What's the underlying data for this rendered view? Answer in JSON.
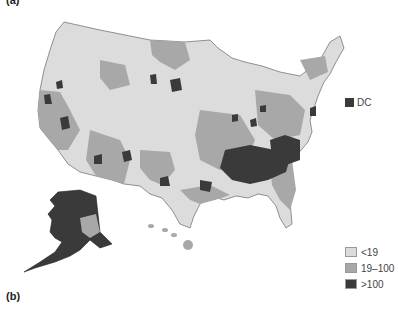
{
  "panels": {
    "a_label": "(a)",
    "b_label": "(b)"
  },
  "map": {
    "region": "United States counties (contiguous US, Alaska, Hawaii)",
    "inset_label": "DC",
    "inset_category": ">100"
  },
  "legend": {
    "items": [
      {
        "label": "<19",
        "color": "#dcdcdc"
      },
      {
        "label": "19–100",
        "color": "#a8a8a8"
      },
      {
        "label": ">100",
        "color": "#3a3a3a"
      }
    ]
  },
  "colors": {
    "low": "#dcdcdc",
    "mid": "#a8a8a8",
    "high": "#3a3a3a",
    "border": "#777777"
  }
}
